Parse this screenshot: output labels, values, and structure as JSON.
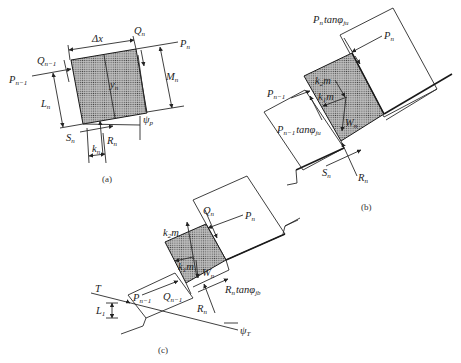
{
  "figure": {
    "panels": [
      {
        "id": "a",
        "caption": "(a)",
        "labels": {
          "dx": "Δx",
          "q_n": "Q",
          "q_n_sub": "n",
          "p_n": "P",
          "p_n_sub": "n",
          "q_n1": "Q",
          "q_n1_sub": "n−1",
          "p_n1": "P",
          "p_n1_sub": "n−1",
          "l_n": "L",
          "l_n_sub": "n",
          "y_n": "y",
          "y_n_sub": "n",
          "m_n": "M",
          "m_n_sub": "n",
          "psi_p": "ψ",
          "psi_p_sub": "p",
          "s_n": "S",
          "s_n_sub": "n",
          "r_n": "R",
          "r_n_sub": "n",
          "k_n": "k",
          "k_n_sub": "n"
        }
      },
      {
        "id": "b",
        "caption": "(b)",
        "labels": {
          "pn_tan": "P",
          "pn_tan_sub": "n",
          "pn_tan_rest": "tanφ",
          "pn_tan_rest_sub": "ju",
          "p_n": "P",
          "p_n_sub": "n",
          "k2m": "k",
          "k2m_sub": "2",
          "k2m_m": "m",
          "k1m": "k",
          "k1m_sub": "1",
          "k1m_m": "m",
          "p_n1": "P",
          "p_n1_sub": "n−1",
          "pn1_tan": "P",
          "pn1_tan_sub": "n−1",
          "pn1_tan_rest": "tanφ",
          "pn1_tan_rest_sub": "ju",
          "w_n": "W",
          "w_n_sub": "n",
          "s_n": "S",
          "s_n_sub": "n",
          "r_n": "R",
          "r_n_sub": "n"
        }
      },
      {
        "id": "c",
        "caption": "(c)",
        "labels": {
          "q_n": "Q",
          "q_n_sub": "n",
          "p_n": "P",
          "p_n_sub": "n",
          "k2m": "k",
          "k2m_sub": "2",
          "k2m_m": "m",
          "k1m": "k",
          "k1m_sub": "1",
          "k1m_m": "m",
          "w_n": "W",
          "w_n_sub": "n",
          "rn_tan": "R",
          "rn_tan_sub": "n",
          "rn_tan_rest": "tanφ",
          "rn_tan_rest_sub": "jb",
          "t": "T",
          "p_n1": "P",
          "p_n1_sub": "n−1",
          "q_n1": "Q",
          "q_n1_sub": "n−1",
          "l_1": "L",
          "l_1_sub": "1",
          "r_n": "R",
          "r_n_sub": "n",
          "psi_t": "ψ",
          "psi_t_sub": "T"
        }
      }
    ]
  }
}
